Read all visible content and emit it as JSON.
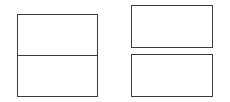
{
  "diagram": {
    "stroke_color": "#3c3c3c",
    "background": "#ffffff",
    "shapes": [
      {
        "id": "left-stacked-box",
        "type": "rectangle",
        "x": 17,
        "y": 14,
        "w": 81,
        "h": 83,
        "divided": true,
        "divider_y": 55
      },
      {
        "id": "right-top-box",
        "type": "rectangle",
        "x": 131,
        "y": 5,
        "w": 82,
        "h": 43
      },
      {
        "id": "right-bottom-box",
        "type": "rectangle",
        "x": 131,
        "y": 54,
        "w": 82,
        "h": 43
      }
    ]
  }
}
